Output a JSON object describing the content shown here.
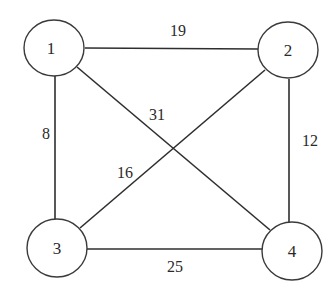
{
  "graph": {
    "nodes": [
      {
        "id": "1",
        "label": "1"
      },
      {
        "id": "2",
        "label": "2"
      },
      {
        "id": "3",
        "label": "3"
      },
      {
        "id": "4",
        "label": "4"
      }
    ],
    "edges": [
      {
        "from": "1",
        "to": "2",
        "weight": "19"
      },
      {
        "from": "1",
        "to": "4",
        "weight": "31"
      },
      {
        "from": "1",
        "to": "3",
        "weight": "8"
      },
      {
        "from": "2",
        "to": "4",
        "weight": "12"
      },
      {
        "from": "2",
        "to": "3",
        "weight": "16"
      },
      {
        "from": "3",
        "to": "4",
        "weight": "25"
      }
    ]
  }
}
